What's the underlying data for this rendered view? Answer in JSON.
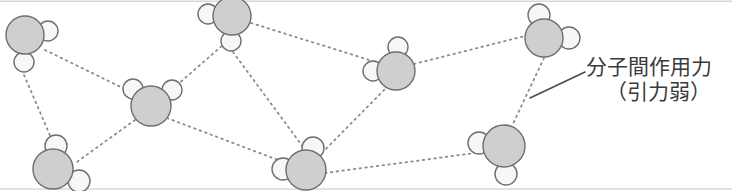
{
  "figure": {
    "width": 732,
    "height": 191,
    "background_color": "#ffffff",
    "border_color": "#d8d8d8"
  },
  "annotation": {
    "line1": "分子間作用力",
    "line2": "（引力弱）",
    "text_color": "#3a3a3a",
    "leader_line": {
      "x1": 530,
      "y1": 98,
      "x2": 585,
      "y2": 72,
      "color": "#4a4a4a",
      "width": 1.6
    }
  },
  "style": {
    "big_atom_fill": "#cfcfcf",
    "big_atom_stroke": "#6e6e6e",
    "small_atom_fill": "#f7f7f7",
    "small_atom_stroke": "#6e6e6e",
    "atom_stroke_width": 1.4,
    "bond_color": "#8c8c8c",
    "bond_width": 1.8,
    "bond_dash": "1.6 4.2"
  },
  "molecules": [
    {
      "id": "molecule-top-left",
      "big": {
        "cx": 25,
        "cy": 35,
        "r": 19
      },
      "small": [
        {
          "cx": 48,
          "cy": 31,
          "r": 10
        },
        {
          "cx": 24,
          "cy": 62,
          "r": 10
        }
      ]
    },
    {
      "id": "molecule-top-center",
      "big": {
        "cx": 232,
        "cy": 16,
        "r": 19
      },
      "small": [
        {
          "cx": 208,
          "cy": 14,
          "r": 10
        },
        {
          "cx": 231,
          "cy": 41,
          "r": 10
        }
      ]
    },
    {
      "id": "molecule-mid-left",
      "big": {
        "cx": 151,
        "cy": 106,
        "r": 20
      },
      "small": [
        {
          "cx": 133,
          "cy": 89,
          "r": 10
        },
        {
          "cx": 172,
          "cy": 90,
          "r": 10
        }
      ]
    },
    {
      "id": "molecule-bottom-left",
      "big": {
        "cx": 53,
        "cy": 169,
        "r": 20
      },
      "small": [
        {
          "cx": 56,
          "cy": 146,
          "r": 11
        },
        {
          "cx": 79,
          "cy": 181,
          "r": 11
        }
      ]
    },
    {
      "id": "molecule-bottom-center",
      "big": {
        "cx": 306,
        "cy": 170,
        "r": 20
      },
      "small": [
        {
          "cx": 313,
          "cy": 148,
          "r": 11
        },
        {
          "cx": 283,
          "cy": 169,
          "r": 11
        }
      ]
    },
    {
      "id": "molecule-mid-right",
      "big": {
        "cx": 396,
        "cy": 71,
        "r": 19
      },
      "small": [
        {
          "cx": 398,
          "cy": 47,
          "r": 10
        },
        {
          "cx": 373,
          "cy": 71,
          "r": 10
        }
      ]
    },
    {
      "id": "molecule-top-right",
      "big": {
        "cx": 544,
        "cy": 38,
        "r": 19
      },
      "small": [
        {
          "cx": 539,
          "cy": 15,
          "r": 11
        },
        {
          "cx": 569,
          "cy": 38,
          "r": 11
        }
      ]
    },
    {
      "id": "molecule-bottom-right",
      "big": {
        "cx": 504,
        "cy": 146,
        "r": 21
      },
      "small": [
        {
          "cx": 479,
          "cy": 143,
          "r": 11
        },
        {
          "cx": 506,
          "cy": 174,
          "r": 11
        }
      ]
    }
  ],
  "bonds": [
    {
      "id": "bond-topleft-midleft",
      "x1": 45,
      "y1": 50,
      "x2": 133,
      "y2": 93
    },
    {
      "id": "bond-topleft-bottomleft",
      "x1": 24,
      "y1": 75,
      "x2": 52,
      "y2": 140
    },
    {
      "id": "bond-midleft-bottomleft",
      "x1": 135,
      "y1": 120,
      "x2": 74,
      "y2": 164
    },
    {
      "id": "bond-midleft-topcenter",
      "x1": 168,
      "y1": 93,
      "x2": 224,
      "y2": 44
    },
    {
      "id": "bond-midleft-bottomcenter",
      "x1": 167,
      "y1": 118,
      "x2": 286,
      "y2": 163
    },
    {
      "id": "bond-topcenter-bottomcenter",
      "x1": 233,
      "y1": 52,
      "x2": 303,
      "y2": 147
    },
    {
      "id": "bond-topcenter-midright",
      "x1": 251,
      "y1": 23,
      "x2": 379,
      "y2": 63
    },
    {
      "id": "bond-bottomcenter-midright",
      "x1": 318,
      "y1": 157,
      "x2": 385,
      "y2": 89
    },
    {
      "id": "bond-bottomcenter-bottomright",
      "x1": 325,
      "y1": 173,
      "x2": 483,
      "y2": 152
    },
    {
      "id": "bond-midright-topright",
      "x1": 414,
      "y1": 64,
      "x2": 525,
      "y2": 36
    },
    {
      "id": "bond-topright-bottomright",
      "x1": 544,
      "y1": 58,
      "x2": 512,
      "y2": 126
    }
  ]
}
